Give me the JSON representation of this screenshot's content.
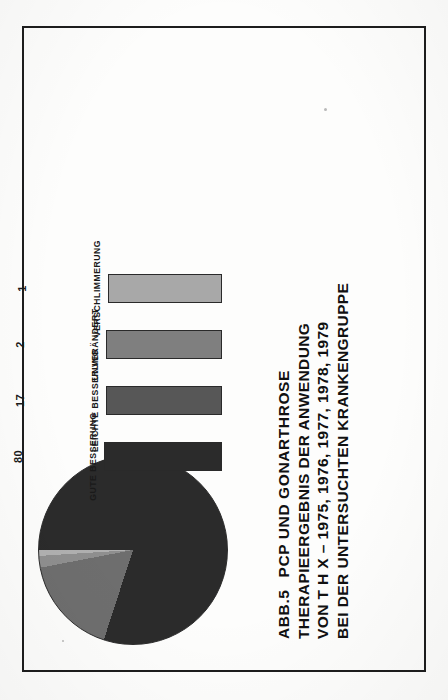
{
  "figure": {
    "number": "ABB.5",
    "title_lines": [
      "PCP UND GONARTHROSE",
      "THERAPIEERGEBNIS DER ANWENDUNG",
      "VON T H X  –   1975, 1976, 1977, 1978, 1979",
      "BEI DER UNTERSUCHTEN KRANKENGRUPPE"
    ],
    "percent_symbol": "%"
  },
  "chart_data": [
    {
      "type": "bar",
      "title": "ABB.5 PCP UND GONARTHROSE — THERAPIEERGEBNIS DER ANWENDUNG VON T H X",
      "categories": [
        "GUTE BESSERUNG",
        "LEICHTE BESSERUNG",
        "UNVERÄNDERT",
        "VERSCHLIMMERUNG"
      ],
      "values": [
        80,
        17,
        2,
        1
      ],
      "value_labels": [
        "80",
        "17",
        "2",
        "1"
      ],
      "unit": "%",
      "xlabel": "",
      "ylabel": "%",
      "ylim": [
        0,
        100
      ],
      "grid": false,
      "legend": "none",
      "note": "All bars drawn at equal height in the print; numeric percentages are printed above each bar.",
      "colors": [
        "#2b2b2b",
        "#575757",
        "#7f7f7f",
        "#a8a8a8"
      ]
    },
    {
      "type": "pie",
      "labels": [
        "GUTE BESSERUNG",
        "LEICHTE BESSERUNG",
        "UNVERÄNDERT",
        "VERSCHLIMMERUNG"
      ],
      "values": [
        80,
        17,
        2,
        1
      ],
      "unit": "%",
      "title": "Therapieergebnis – Verteilung",
      "legend": "none",
      "start_angle_deg": 0,
      "colors": [
        "#2b2b2b",
        "#6e6e6e",
        "#8f8f8f",
        "#b0b0b0"
      ]
    }
  ],
  "bars": [
    {
      "label": "GUTE BESSERUNG",
      "value": "80",
      "color": "#2b2b2b",
      "height_px": 118
    },
    {
      "label": "LEICHTE BESSERUNG",
      "value": "17",
      "color": "#575757",
      "height_px": 116
    },
    {
      "label": "UNVERÄNDERT",
      "value": "2",
      "color": "#7f7f7f",
      "height_px": 116
    },
    {
      "label": "VERSCHLIMMERUNG",
      "value": "1",
      "color": "#a8a8a8",
      "height_px": 114
    }
  ]
}
